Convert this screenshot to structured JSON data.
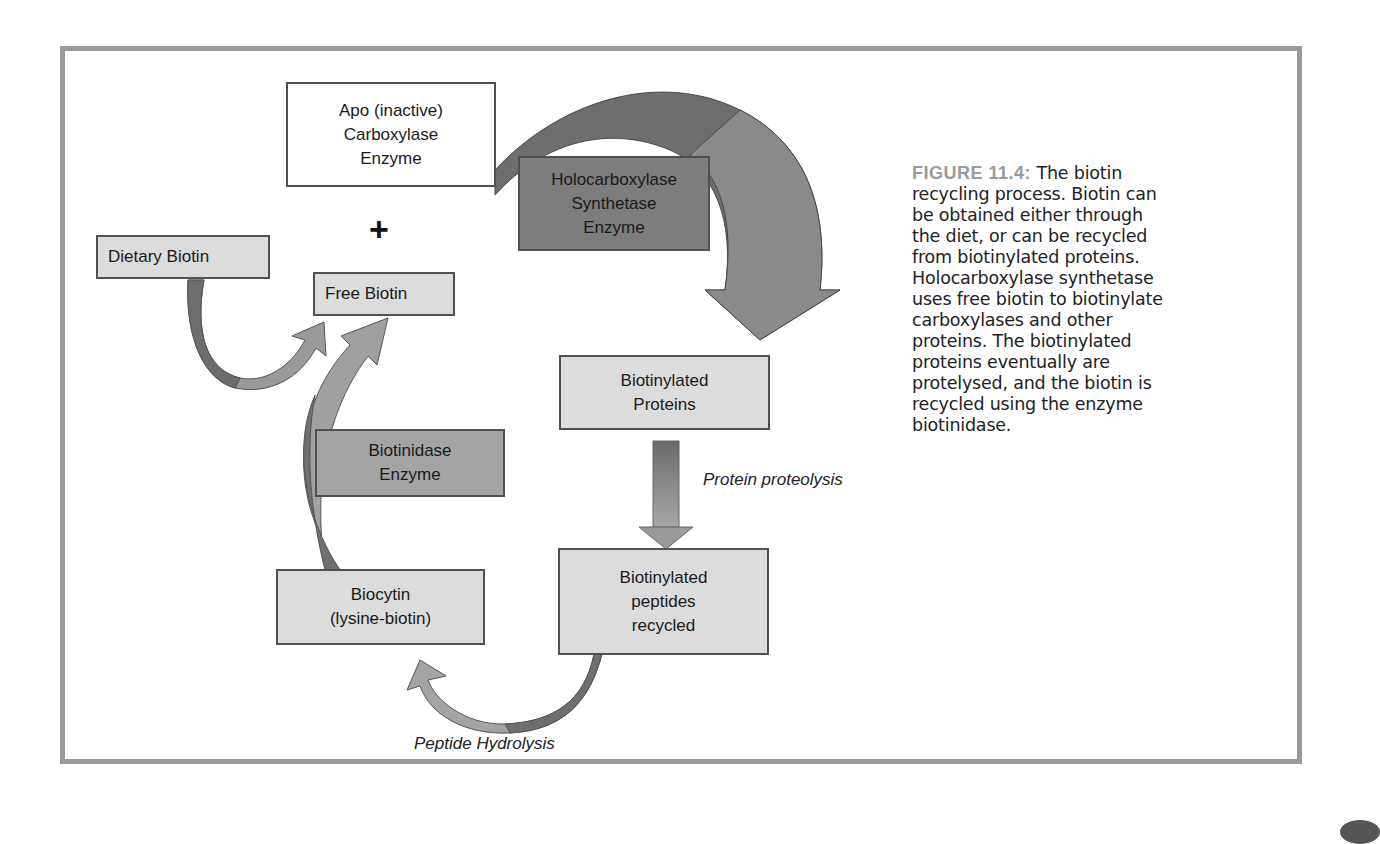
{
  "figure": {
    "label": "FIGURE 11.4:",
    "caption_lines": [
      "The biotin",
      "recycling process.  Biotin can",
      "be obtained either through",
      "the diet, or can be recycled",
      "from biotinylated proteins.",
      "Holocarboxylase synthetase",
      "uses free biotin to biotinylate",
      "carboxylases and other",
      "proteins.  The biotinylated",
      "proteins eventually are",
      "protelysed, and the biotin is",
      "recycled using the enzyme",
      "biotinidase."
    ]
  },
  "diagram": {
    "nodes": {
      "apo_carboxylase": "Apo (inactive)\nCarboxylase\nEnzyme",
      "holocarboxylase_synthetase": "Holocarboxylase\nSynthetase\nEnzyme",
      "dietary_biotin": "Dietary Biotin",
      "free_biotin": "Free Biotin",
      "biotinylated_proteins": "Biotinylated\nProteins",
      "biotinidase": "Biotinidase\nEnzyme",
      "biotinylated_peptides": "Biotinylated\npeptides\nrecycled",
      "biocytin": "Biocytin\n(lysine-biotin)"
    },
    "plus_sign": "+",
    "edge_labels": {
      "protein_proteolysis": "Protein proteolysis",
      "peptide_hydrolysis": "Peptide Hydrolysis"
    },
    "colors": {
      "frame": "#9a9a9a",
      "box_light": "#dcdcdc",
      "box_mid": "#a4a4a4",
      "box_dark": "#7d7d7d",
      "arrow_dark": "#6e6e6e",
      "arrow_light": "#a8a8a8"
    }
  }
}
